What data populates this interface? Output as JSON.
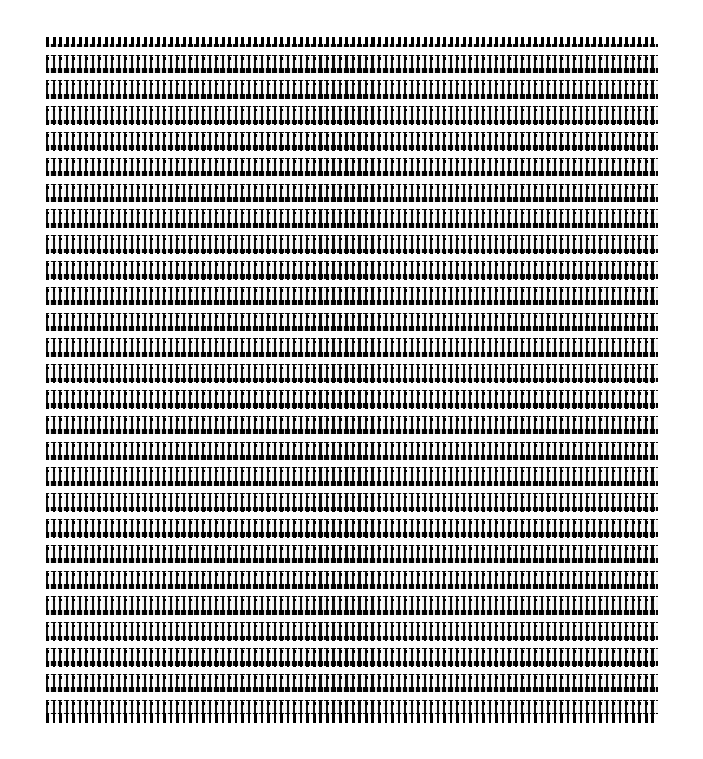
{
  "page": {
    "background_color": "#ffffff",
    "width": 703,
    "height": 759,
    "description": "Extremely zoomed-out dense data table rendered at sub-pixel text size; individual glyphs are unreadable and appear as a black-and-white moire pattern."
  },
  "table": {
    "name": "dense-data-table",
    "left": 46,
    "top": 37,
    "width": 612,
    "height": 686,
    "row_band_count": 26,
    "column_count": 94,
    "row_pitch_px": 25.8,
    "column_pitch_px": 6.51,
    "ink_color": "#000000",
    "cell_color": "#ffffff",
    "header_band_color": "#0a0a0a",
    "data_band_color": "#f4f4f4",
    "header_row_label": "header-row",
    "footer_row_label": "footer-row",
    "content_legibility": "illegible"
  },
  "regions": {
    "header_strip_label": "column header strip",
    "band_body_label": "alternating data bands",
    "footer_strip_label": "table bottom edge",
    "margin_label": "white page margin"
  }
}
